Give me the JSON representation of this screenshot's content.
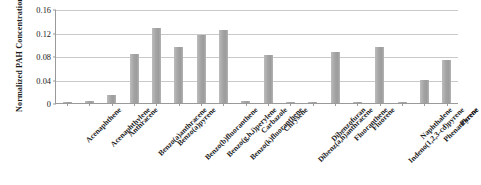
{
  "chart_data": {
    "type": "bar",
    "title": "",
    "xlabel": "",
    "ylabel": "Normalized PAH Concentration",
    "ylim": [
      0,
      0.16
    ],
    "yticks": [
      "0",
      "0.04",
      "0.08",
      "0.12",
      "0.16"
    ],
    "ytick_values": [
      0,
      0.04,
      0.08,
      0.12,
      0.16
    ],
    "grid": true,
    "legend": "none",
    "series_color": "#a3a3a3",
    "categories": [
      "Acenaphthene",
      "Acenaphthylene",
      "Anthracene",
      "Benzo(a)anthracene",
      "Benzo(a)pyrene",
      "Benzo(b)fluoranthene",
      "Benzo(g,h,i)perylene",
      "Benzo(k)fluoranthene",
      "Carbazole",
      "Chrysene",
      "Dibenz(a,h)anthracene",
      "Dibenzofuran",
      "Fluoranthene",
      "Fluorene",
      "Indeno(1,2,3-cd)pyrene",
      "Naphthalene",
      "Phenanthrene",
      "Pyrene"
    ],
    "values": [
      0.001,
      0.004,
      0.013,
      0.084,
      0.128,
      0.096,
      0.116,
      0.124,
      0.003,
      0.082,
      0.002,
      0.001,
      0.086,
      0.002,
      0.096,
      0.001,
      0.039,
      0.073
    ]
  }
}
